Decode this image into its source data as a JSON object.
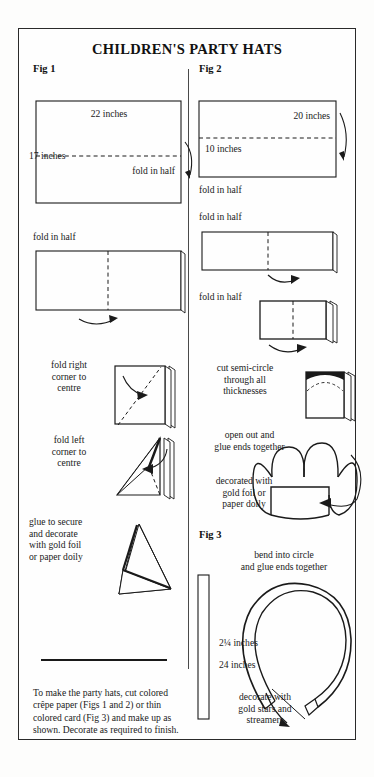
{
  "document": {
    "title": "CHILDREN'S PARTY HATS",
    "sections": [
      {
        "id": "fig1",
        "label": "Fig 1"
      },
      {
        "id": "fig2",
        "label": "Fig 2"
      },
      {
        "id": "fig3",
        "label": "Fig 3"
      }
    ]
  },
  "fig1": {
    "label": "Fig 1",
    "width_dim": "22 inches",
    "height_dim": "17 inches",
    "step1_caption": "fold in half",
    "step2_caption": "fold in half",
    "step3_caption": "fold right\ncorner to\ncentre",
    "step4_caption": "fold left\ncorner to\ncentre",
    "step5_caption": "glue to secure\nand decorate\nwith gold foil\nor paper doily"
  },
  "fig2": {
    "label": "Fig 2",
    "width_dim": "20 inches",
    "height_dim": "10 inches",
    "step1_caption": "fold in half",
    "step2_caption": "fold in half",
    "step3_caption": "fold in half",
    "step4_caption": "cut semi-circle\nthrough all\nthicknesses",
    "step5_caption": "open out and\nglue ends together",
    "step6_caption": "decorated with\ngold foil or\npaper doily"
  },
  "fig3": {
    "label": "Fig 3",
    "top_caption": "bend into circle\nand glue ends together",
    "width_dim": "2¼ inches",
    "length_dim": "24 inches",
    "bottom_caption": "decorate with\ngold stars and\nstreamers"
  },
  "footer": {
    "text": "To make the party hats, cut colored crêpe paper (Figs 1 and 2) or thin colored card (Fig 3) and make up as shown. Decorate as required to finish."
  },
  "colors": {
    "ink": "#1a1a1a",
    "paper": "#fefefe",
    "border": "#2a2a2a"
  }
}
